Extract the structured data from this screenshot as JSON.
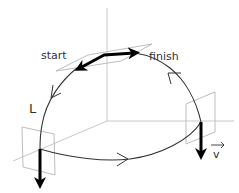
{
  "diagram": {
    "labels": {
      "start": "start",
      "finish": "finish",
      "path": "L",
      "velocity": "v",
      "velocity_arrow": "→"
    },
    "colors": {
      "background": "#ffffff",
      "axes": "#c8c8c8",
      "planes": "#bdbdbd",
      "curve": "#333333",
      "bold_arrows": "#000000",
      "text": "#333333"
    }
  }
}
